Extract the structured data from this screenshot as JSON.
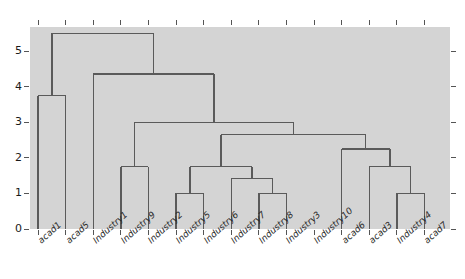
{
  "chart_data": {
    "type": "dendrogram",
    "title": "",
    "xlabel": "",
    "ylabel": "",
    "ylim": [
      0,
      5.75
    ],
    "yticks": [
      0,
      1,
      2,
      3,
      4,
      5
    ],
    "ytick_labels": [
      "0",
      "1",
      "2",
      "3",
      "4",
      "5"
    ],
    "grid": false,
    "legend": "none",
    "plot_background": "#d4d4d4",
    "line_color": "#5a5a5a",
    "leaves": [
      "acad1",
      "acad5",
      "Industry1",
      "Industry9",
      "Industry2",
      "Industry5",
      "Industry6",
      "Industry7",
      "Industry8",
      "Industry3",
      "Industry10",
      "acad6",
      "acad3",
      "Industry4",
      "acad7"
    ],
    "merges": [
      {
        "id": "m1",
        "left": "acad1",
        "right": "acad5",
        "height": 3.75
      },
      {
        "id": "m2",
        "left": "Industry9",
        "right": "Industry2",
        "height": 1.75
      },
      {
        "id": "m3",
        "left": "Industry5",
        "right": "Industry6",
        "height": 1.0
      },
      {
        "id": "m4",
        "left": "Industry8",
        "right": "Industry3",
        "height": 1.0
      },
      {
        "id": "m5",
        "left": "Industry7",
        "right": "m4",
        "height": 1.42
      },
      {
        "id": "m6",
        "left": "m3",
        "right": "m5",
        "height": 1.75
      },
      {
        "id": "m7",
        "left": "Industry4",
        "right": "acad7",
        "height": 1.0
      },
      {
        "id": "m8",
        "left": "acad3",
        "right": "m7",
        "height": 1.75
      },
      {
        "id": "m9",
        "left": "acad6",
        "right": "m8",
        "height": 2.25
      },
      {
        "id": "m10",
        "left": "m6",
        "right": "m9",
        "height": 2.65
      },
      {
        "id": "m11",
        "left": "m2",
        "right": "m10",
        "height": 3.0
      },
      {
        "id": "m12",
        "left": "Industry1",
        "right": "m11",
        "height": 4.35
      },
      {
        "id": "m13",
        "left": "m1",
        "right": "m12",
        "height": 5.5
      }
    ]
  }
}
